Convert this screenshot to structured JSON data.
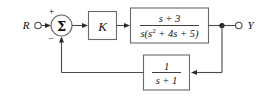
{
  "diagram": {
    "type": "control-block-diagram",
    "input": {
      "label": "R",
      "terminal": "open-circle"
    },
    "output": {
      "label": "Y",
      "terminal": "open-circle"
    },
    "summing_junction": {
      "symbol": "Σ",
      "positive_sign": "+",
      "negative_sign": "−",
      "positive_input": "R",
      "negative_input": "feedback"
    },
    "blocks": [
      {
        "id": "gain",
        "name": "gain-block",
        "label": "K",
        "kind": "gain"
      },
      {
        "id": "plant",
        "name": "plant-block",
        "kind": "transfer-function",
        "numerator": "s + 3",
        "denominator": "s(s² + 4s + 5)",
        "denominator_base": "s(s",
        "denominator_exponent": "2",
        "denominator_rest": " + 4s + 5)"
      },
      {
        "id": "feedback",
        "name": "feedback-block",
        "kind": "transfer-function",
        "numerator": "1",
        "denominator": "s + 1"
      }
    ],
    "nodes": [
      {
        "name": "output-takeoff-node",
        "kind": "junction-dot"
      }
    ],
    "colors": {
      "wire": "#4a4a4a",
      "block_border": "#6a6a6a",
      "text": "#111111",
      "background": "#ffffff"
    }
  }
}
